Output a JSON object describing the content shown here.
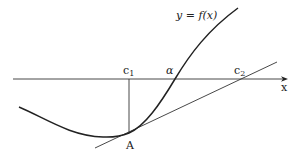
{
  "diagram": {
    "type": "newton-method-illustration",
    "curve_label": "y = f(x)",
    "axis": {
      "x_label": "x"
    },
    "points": {
      "c1": {
        "label": "c",
        "subscript": "1"
      },
      "alpha": {
        "label": "α"
      },
      "c2": {
        "label": "c",
        "subscript": "2"
      },
      "A": {
        "label": "A"
      }
    },
    "colors": {
      "stroke": "#222222",
      "background": "#ffffff"
    }
  }
}
